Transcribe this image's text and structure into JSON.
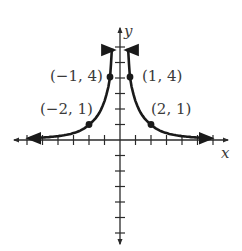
{
  "chart_data": {
    "type": "line",
    "title": "",
    "function": "y = 4 / x^2",
    "xlabel": "x",
    "ylabel": "y",
    "xlim": [
      -6,
      6
    ],
    "ylim": [
      -6,
      6
    ],
    "grid": false,
    "legend": null,
    "x_ticks": [
      -6,
      -5,
      -4,
      -3,
      -2,
      -1,
      1,
      2,
      3,
      4,
      5,
      6
    ],
    "y_ticks": [
      -6,
      -5,
      -4,
      -3,
      -2,
      -1,
      1,
      2,
      3,
      4,
      5,
      6
    ],
    "series": [
      {
        "name": "left branch",
        "x": [
          -5.8,
          -4,
          -3,
          -2,
          -1.5,
          -1,
          -0.85
        ],
        "y": [
          0.12,
          0.25,
          0.44,
          1,
          1.78,
          4,
          5.5
        ]
      },
      {
        "name": "right branch",
        "x": [
          0.85,
          1,
          1.5,
          2,
          3,
          4,
          5.8
        ],
        "y": [
          5.5,
          4,
          1.78,
          1,
          0.44,
          0.25,
          0.12
        ]
      }
    ],
    "points": [
      {
        "x": -2,
        "y": 1,
        "label": "(−2, 1)"
      },
      {
        "x": -1,
        "y": 4,
        "label": "(−1, 4)"
      },
      {
        "x": 1,
        "y": 4,
        "label": "(1, 4)"
      },
      {
        "x": 2,
        "y": 1,
        "label": "(2, 1)"
      }
    ],
    "colors": {
      "curve": "#1a1a1a",
      "axis": "#2a2a2a",
      "text": "#3a3a3a"
    }
  },
  "labels": {
    "x_axis": "x",
    "y_axis": "y",
    "p_m2_1": "(−2, 1)",
    "p_m1_4": "(−1, 4)",
    "p_1_4": "(1, 4)",
    "p_2_1": "(2, 1)"
  }
}
